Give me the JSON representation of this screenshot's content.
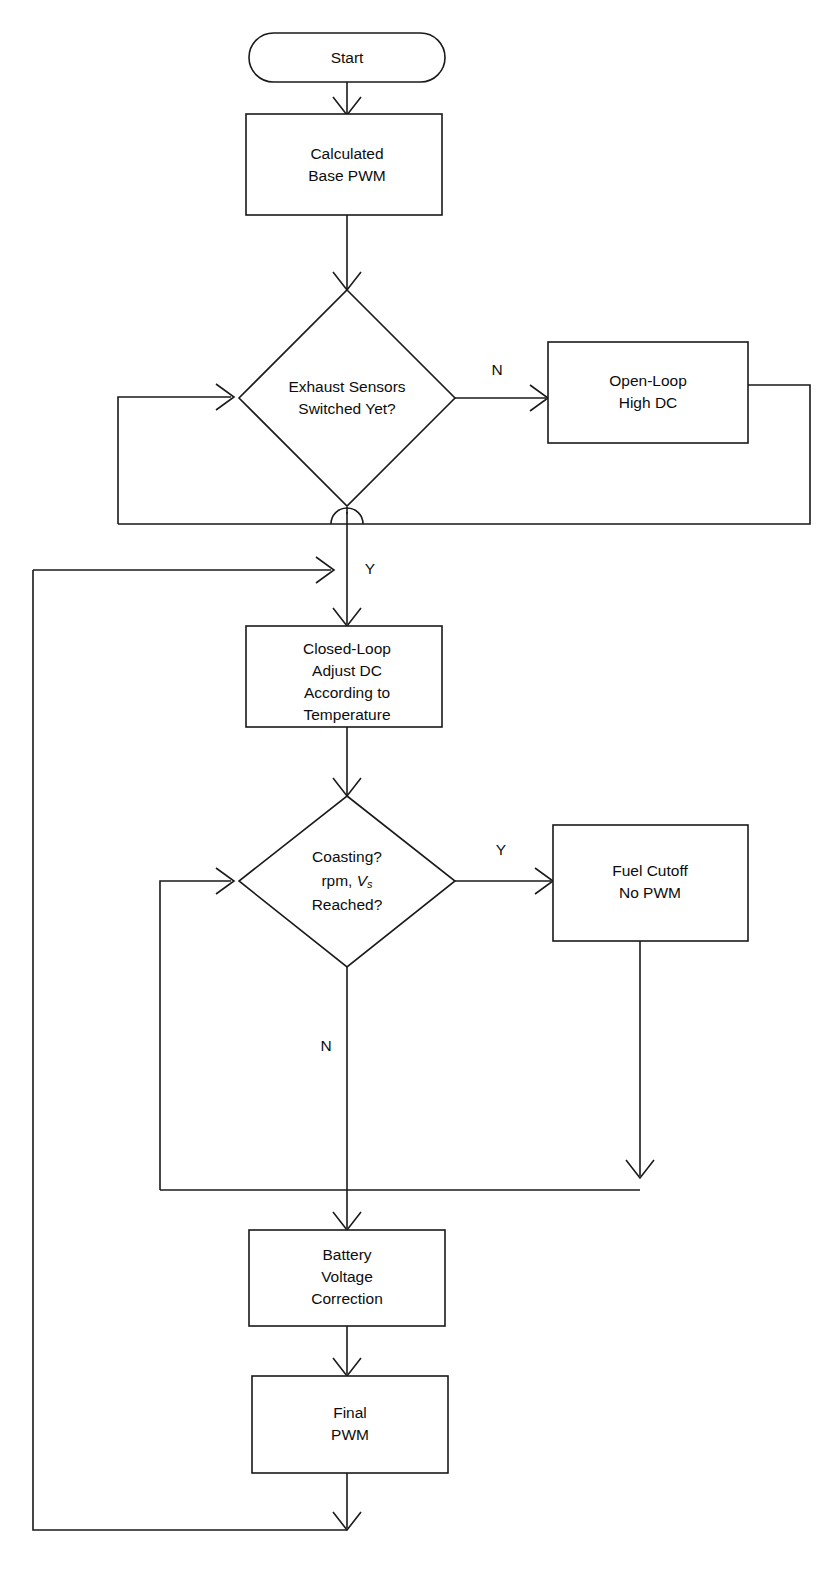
{
  "diagram": {
    "type": "flowchart",
    "background_color": "#ffffff",
    "line_color": "#1a1a1a",
    "text_color": "#0d0d0d",
    "nodes": {
      "start": {
        "shape": "terminator",
        "label": "Start"
      },
      "base_pwm": {
        "shape": "process",
        "line1": "Calculated",
        "line2": "Base PWM"
      },
      "exhaust_decision": {
        "shape": "decision",
        "line1": "Exhaust Sensors",
        "line2": "Switched Yet?"
      },
      "open_loop": {
        "shape": "process",
        "line1": "Open-Loop",
        "line2": "High DC"
      },
      "closed_loop": {
        "shape": "process",
        "line1": "Closed-Loop",
        "line2": "Adjust DC",
        "line3": "According to",
        "line4": "Temperature"
      },
      "coasting_decision": {
        "shape": "decision",
        "line1": "Coasting?",
        "line2_prefix": "rpm, ",
        "line2_var": "V",
        "line2_sub": "s",
        "line3": "Reached?"
      },
      "fuel_cutoff": {
        "shape": "process",
        "line1": "Fuel Cutoff",
        "line2": "No PWM"
      },
      "battery_correction": {
        "shape": "process",
        "line1": "Battery",
        "line2": "Voltage",
        "line3": "Correction"
      },
      "final_pwm": {
        "shape": "process",
        "line1": "Final",
        "line2": "PWM"
      }
    },
    "branch_labels": {
      "exhaust_no": "N",
      "exhaust_yes": "Y",
      "coasting_yes": "Y",
      "coasting_no": "N"
    }
  }
}
